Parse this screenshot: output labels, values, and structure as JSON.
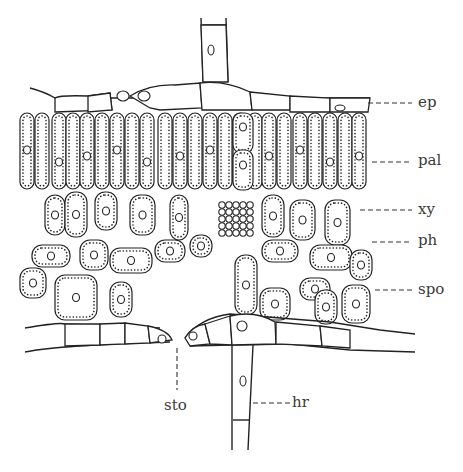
{
  "figure": {
    "type": "leaf cross-section",
    "labels": {
      "epidermis": "ep",
      "palisade": "pal",
      "xylem": "xy",
      "phloem": "ph",
      "spongy": "spo",
      "stoma": "sto",
      "hair": "hr"
    }
  }
}
